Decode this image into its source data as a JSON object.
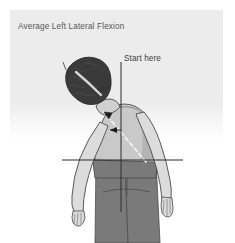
{
  "panel": {
    "title": "Average Left Lateral Flexion",
    "background_color": "#ececec",
    "page_background": "#ffffff"
  },
  "illustration": {
    "name": "lateral-flexion-diagram",
    "subject": "person bending torso to the left",
    "reference_lines": {
      "vertical_label": "Start here",
      "vertical_color": "#2b2d2f",
      "horizontal_color": "#2b2d2f"
    },
    "angle": {
      "value": "40°",
      "degrees": 40,
      "color": "#2e3032"
    },
    "colors": {
      "hair": "#3a3a3a",
      "skin": "#d9d9d9",
      "skin_outline": "#4a4a4a",
      "shirt": "#c9c9c9",
      "shorts": "#7a7a7a",
      "spine_dash": "#f2f2f2",
      "arrow": "#1c1c1c"
    }
  }
}
